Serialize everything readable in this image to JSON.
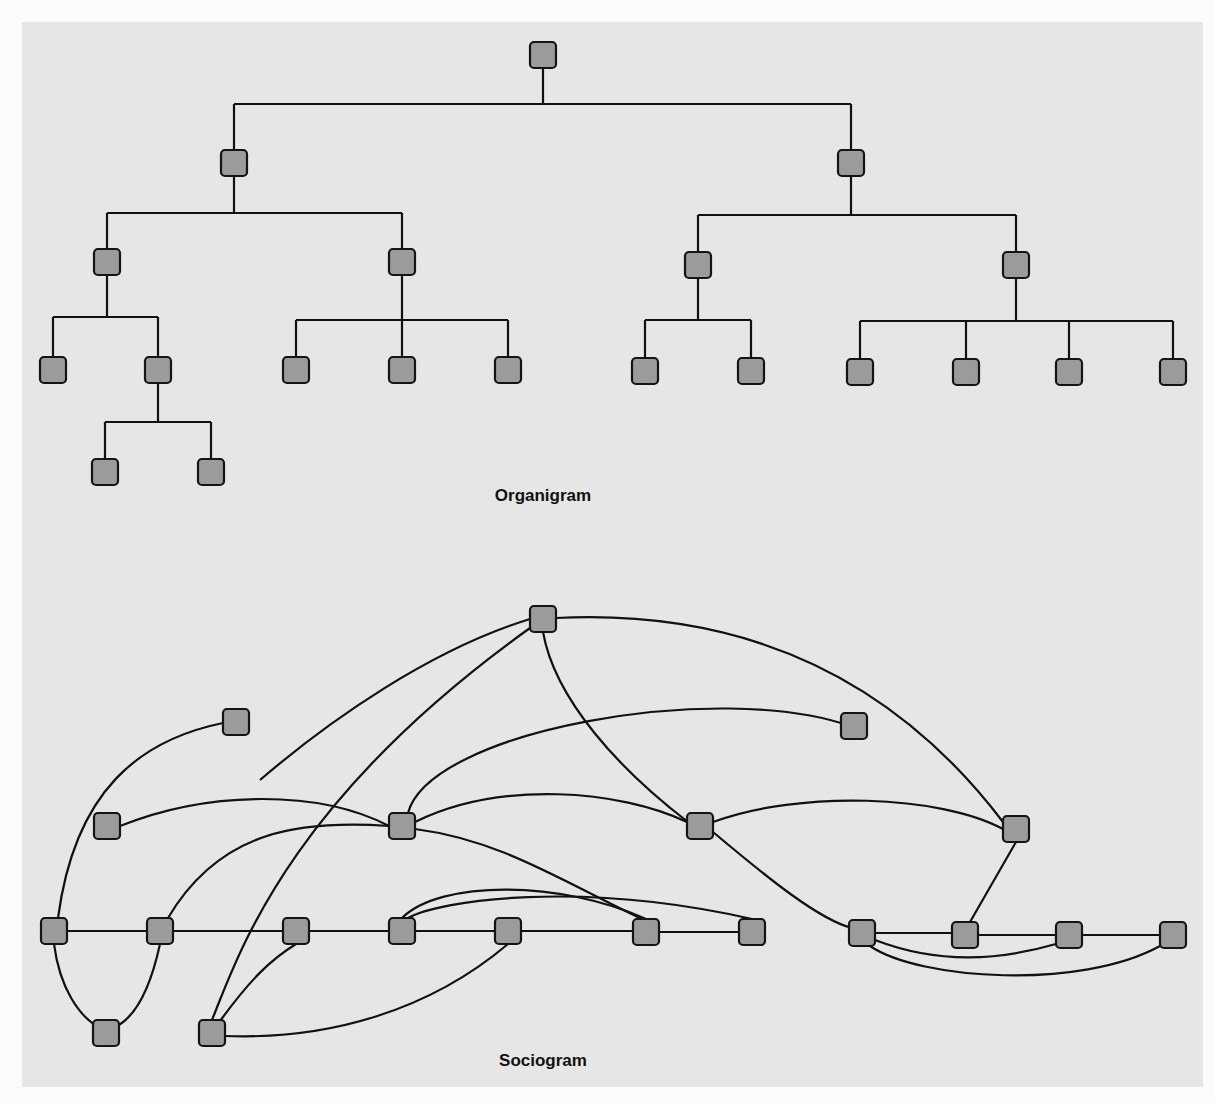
{
  "figure": {
    "organigram": {
      "caption": "Organigram",
      "node_shape": "rounded-square",
      "node_fill": "#9b9b9b",
      "edge_color": "#111111",
      "nodes": [
        {
          "id": "root",
          "x": 543,
          "y": 55
        },
        {
          "id": "a",
          "x": 234,
          "y": 163
        },
        {
          "id": "b",
          "x": 851,
          "y": 163
        },
        {
          "id": "a1",
          "x": 107,
          "y": 262
        },
        {
          "id": "a2",
          "x": 402,
          "y": 262
        },
        {
          "id": "b1",
          "x": 698,
          "y": 265
        },
        {
          "id": "b2",
          "x": 1016,
          "y": 265
        },
        {
          "id": "a1a",
          "x": 53,
          "y": 370
        },
        {
          "id": "a1b",
          "x": 158,
          "y": 370
        },
        {
          "id": "a2a",
          "x": 296,
          "y": 370
        },
        {
          "id": "a2b",
          "x": 402,
          "y": 370
        },
        {
          "id": "a2c",
          "x": 508,
          "y": 370
        },
        {
          "id": "b1a",
          "x": 645,
          "y": 371
        },
        {
          "id": "b1b",
          "x": 751,
          "y": 371
        },
        {
          "id": "b2a",
          "x": 860,
          "y": 372
        },
        {
          "id": "b2b",
          "x": 966,
          "y": 372
        },
        {
          "id": "b2c",
          "x": 1069,
          "y": 372
        },
        {
          "id": "b2d",
          "x": 1173,
          "y": 372
        },
        {
          "id": "a1b1",
          "x": 105,
          "y": 472
        },
        {
          "id": "a1b2",
          "x": 211,
          "y": 472
        }
      ],
      "edges": [
        "M543 68 V104 M234 104 H851 M234 104 V150 M851 104 V150",
        "M234 176 V213 M107 213 H402 M107 213 V249 M402 213 V249",
        "M851 176 V215 M698 215 H1016 M698 215 V252 M1016 215 V252",
        "M107 275 V317 M53 317 H158 M53 317 V357 M158 317 V357",
        "M402 275 V320 M296 320 H508 M296 320 V357 M402 320 V357 M508 320 V357",
        "M698 278 V320 M645 320 H751 M645 320 V358 M751 320 V358",
        "M1016 278 V321 M860 321 H1173 M860 321 V359 M966 321 V359 M1069 321 V359 M1173 321 V359",
        "M158 383 V422 M105 422 H211 M105 422 V459 M211 422 V459"
      ]
    },
    "sociogram": {
      "caption": "Sociogram",
      "node_shape": "rounded-square",
      "node_fill": "#9b9b9b",
      "edge_color": "#111111",
      "nodes": [
        {
          "id": "A",
          "x": 543,
          "y": 619
        },
        {
          "id": "B",
          "x": 236,
          "y": 722
        },
        {
          "id": "C",
          "x": 854,
          "y": 726
        },
        {
          "id": "D",
          "x": 107,
          "y": 826
        },
        {
          "id": "E",
          "x": 402,
          "y": 826
        },
        {
          "id": "F",
          "x": 700,
          "y": 826
        },
        {
          "id": "G",
          "x": 1016,
          "y": 829
        },
        {
          "id": "H",
          "x": 54,
          "y": 931
        },
        {
          "id": "I",
          "x": 160,
          "y": 931
        },
        {
          "id": "J",
          "x": 296,
          "y": 931
        },
        {
          "id": "K",
          "x": 402,
          "y": 931
        },
        {
          "id": "L",
          "x": 508,
          "y": 931
        },
        {
          "id": "M",
          "x": 646,
          "y": 932
        },
        {
          "id": "N",
          "x": 752,
          "y": 932
        },
        {
          "id": "O",
          "x": 862,
          "y": 933
        },
        {
          "id": "P",
          "x": 965,
          "y": 935
        },
        {
          "id": "Q",
          "x": 1069,
          "y": 935
        },
        {
          "id": "R",
          "x": 1173,
          "y": 935
        },
        {
          "id": "S",
          "x": 106,
          "y": 1033
        },
        {
          "id": "T",
          "x": 212,
          "y": 1033
        }
      ],
      "edges": [
        "M530 619 C430 650 330 720 260 780",
        "M556 618 C720 610 880 660 1003 822",
        "M543 632 C555 700 620 770 688 822",
        "M223 723 C140 740 75 790 58 918",
        "M120 826 C210 790 320 790 389 826",
        "M408 813 C430 730 720 680 850 726",
        "M415 822 C500 780 620 790 687 822",
        "M389 826 C300 820 220 830 168 918",
        "M415 829 C500 840 560 880 642 919",
        "M713 822 C800 790 940 795 1003 829",
        "M713 832 C770 880 820 920 852 928",
        "M1016 842 L970 922",
        "M67 931 H147 M173 931 H283 M309 931 H389 M415 931 H495 M521 931 H633",
        "M659 932 H739",
        "M875 933 H952 M978 935 H1056 M1082 935 H1160",
        "M54 944 C60 990 80 1015 95 1025",
        "M160 944 C150 990 135 1015 119 1025",
        "M212 1020 C240 950 290 800 530 628",
        "M220 1021 C250 980 270 960 296 944",
        "M225 1036 C330 1040 430 1010 508 944",
        "M402 918 C440 880 560 880 646 919",
        "M408 918 C440 900 580 880 752 919",
        "M875 940 C940 965 1000 960 1056 944",
        "M870 946 C920 980 1080 990 1160 946"
      ]
    }
  }
}
